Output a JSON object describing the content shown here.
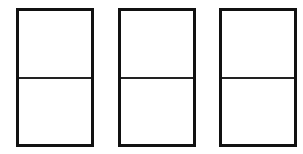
{
  "diagram": {
    "stroke_color": "#111111",
    "background": "#ffffff",
    "boxes": [
      {
        "id": "box-1",
        "sections": 2
      },
      {
        "id": "box-2",
        "sections": 2
      },
      {
        "id": "box-3",
        "sections": 2
      }
    ]
  }
}
